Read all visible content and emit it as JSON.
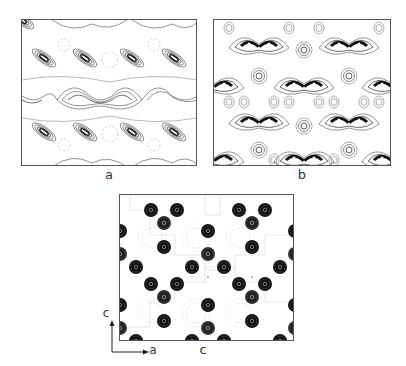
{
  "figure": {
    "panels": [
      {
        "id": "a",
        "label": "a",
        "description": "contour map with elongated diagonal peaks and butterfly-shaped lobes"
      },
      {
        "id": "b",
        "label": "b",
        "description": "contour map with chevron (V) shaped dense features and small circular contours"
      },
      {
        "id": "c",
        "label": "c",
        "description": "contour map with dense dark atom-like circles in triangular clusters"
      }
    ],
    "axes": {
      "vertical": "c",
      "horizontal": "a"
    }
  },
  "colors": {
    "contour": "#555555",
    "dense": "#111111",
    "frame": "#555555",
    "background": "#ffffff"
  }
}
